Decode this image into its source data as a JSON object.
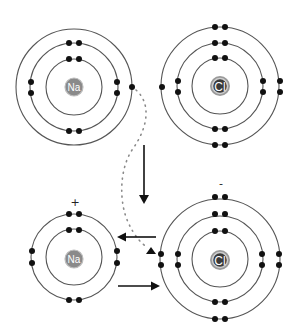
{
  "diagram": {
    "colors": {
      "shell": "#555555",
      "electron": "#111111",
      "na_nucleus": "#8a8a8a",
      "cl_nucleus": "#3a3a3a",
      "arrow": "#111111",
      "transfer_path": "#8a8a8a"
    },
    "atoms": [
      {
        "id": "na-atom",
        "symbol": "Na",
        "charge": "",
        "center": [
          74,
          87
        ],
        "shell_radii": [
          28,
          44,
          58
        ],
        "electrons_per_shell": [
          2,
          8,
          1
        ]
      },
      {
        "id": "cl-atom",
        "symbol": "Cl",
        "charge": "",
        "center": [
          220,
          86
        ],
        "shell_radii": [
          28,
          43,
          59
        ],
        "electrons_per_shell": [
          2,
          8,
          7
        ]
      },
      {
        "id": "na-ion",
        "symbol": "Na",
        "charge": "+",
        "center": [
          74,
          257
        ],
        "shell_radii": [
          28,
          43
        ],
        "electrons_per_shell": [
          2,
          8
        ]
      },
      {
        "id": "cl-ion",
        "symbol": "Cl",
        "charge": "-",
        "center": [
          220,
          258
        ],
        "shell_radii": [
          28,
          43,
          60
        ],
        "electrons_per_shell": [
          2,
          8,
          8
        ]
      }
    ],
    "arrows": [
      {
        "id": "down-arrow",
        "from": [
          144,
          145
        ],
        "to": [
          144,
          203
        ],
        "meaning": "reaction proceeds"
      },
      {
        "id": "left-arrow",
        "from": [
          156,
          237
        ],
        "to": [
          117,
          237
        ],
        "meaning": "electrostatic attraction"
      },
      {
        "id": "right-arrow",
        "from": [
          118,
          286
        ],
        "to": [
          160,
          286
        ],
        "meaning": "electrostatic attraction"
      }
    ],
    "transfer": {
      "id": "electron-transfer-path",
      "style": "dotted",
      "from": [
        133,
        88
      ],
      "to": [
        151,
        252
      ]
    }
  }
}
